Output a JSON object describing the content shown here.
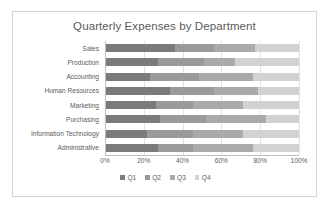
{
  "chart_data": {
    "type": "bar",
    "subtype": "100% stacked horizontal bar",
    "title": "Quarterly Expenses by Department",
    "xlabel": "",
    "ylabel": "",
    "xlim": [
      0,
      100
    ],
    "xticks": [
      "0%",
      "20%",
      "40%",
      "60%",
      "80%",
      "100%"
    ],
    "xtick_values": [
      0,
      20,
      40,
      60,
      80,
      100
    ],
    "grid": true,
    "grid_axis": "x",
    "legend_position": "bottom",
    "orientation": "horizontal",
    "categories": [
      "Sales",
      "Production",
      "Accounting",
      "Human Resources",
      "Marketing",
      "Purchasing",
      "Information Technology",
      "Administrative"
    ],
    "series": [
      {
        "name": "Q1",
        "color": "#7b7b7b",
        "values": [
          36,
          27,
          23,
          33,
          26,
          28,
          21,
          27
        ]
      },
      {
        "name": "Q2",
        "color": "#9a9a9a",
        "values": [
          20,
          24,
          25,
          23,
          19,
          24,
          24,
          18
        ]
      },
      {
        "name": "Q3",
        "color": "#aaaaaa",
        "values": [
          21,
          16,
          28,
          23,
          26,
          31,
          26,
          31
        ]
      },
      {
        "name": "Q4",
        "color": "#d2d2d2",
        "values": [
          23,
          33,
          24,
          21,
          29,
          17,
          29,
          24
        ]
      }
    ],
    "cumulative_boundaries": [
      [
        36,
        56,
        77,
        100
      ],
      [
        27,
        51,
        67,
        100
      ],
      [
        23,
        48,
        76,
        100
      ],
      [
        33,
        56,
        79,
        100
      ],
      [
        26,
        45,
        71,
        100
      ],
      [
        28,
        52,
        83,
        100
      ],
      [
        21,
        45,
        71,
        100
      ],
      [
        27,
        45,
        76,
        100
      ]
    ]
  },
  "legend": {
    "items": [
      {
        "label": "Q1"
      },
      {
        "label": "Q2"
      },
      {
        "label": "Q3"
      },
      {
        "label": "Q4"
      }
    ]
  },
  "colors": {
    "q1": "#7b7b7b",
    "q2": "#9a9a9a",
    "q3": "#aaaaaa",
    "q4": "#d2d2d2",
    "text": "#5c5c5c",
    "border": "#d4d4d4",
    "grid": "#e2e2e2",
    "axis": "#bfbfbf",
    "background": "#ffffff"
  }
}
